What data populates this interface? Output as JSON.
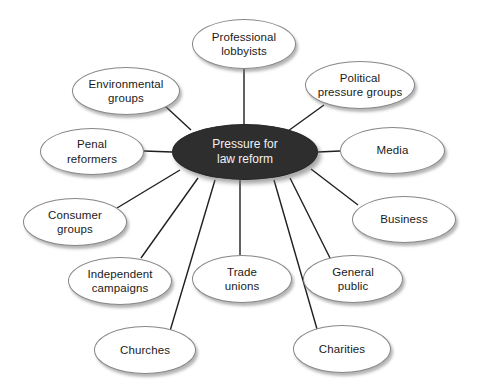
{
  "diagram": {
    "type": "hub-and-spoke",
    "background_color": "#ffffff",
    "center": {
      "label": "Pressure for law reform",
      "line1": "Pressure for",
      "line2": "law reform",
      "fill_color": "#2e2e2e",
      "text_color": "#f2f2f2",
      "x": 172,
      "y": 124,
      "width": 146,
      "height": 56
    },
    "node_style": {
      "fill_color": "#ffffff",
      "border_color": "#878787",
      "text_color": "#1a1a1a",
      "shadow_color": "#787878"
    },
    "nodes": [
      {
        "id": "professional-lobbyists",
        "label": "Professional lobbyists",
        "line1": "Professional",
        "line2": "lobbyists",
        "x": 192,
        "y": 19,
        "width": 104,
        "height": 50,
        "anchor_x": 244,
        "anchor_y": 69
      },
      {
        "id": "political-pressure-groups",
        "label": "Political pressure groups",
        "line1": "Political",
        "line2": "pressure groups",
        "x": 305,
        "y": 61,
        "width": 110,
        "height": 48,
        "anchor_x": 324,
        "anchor_y": 105
      },
      {
        "id": "media",
        "label": "Media",
        "line1": "Media",
        "line2": "",
        "x": 340,
        "y": 127,
        "width": 105,
        "height": 47,
        "anchor_x": 340,
        "anchor_y": 151
      },
      {
        "id": "business",
        "label": "Business",
        "line1": "Business",
        "line2": "",
        "x": 352,
        "y": 196,
        "width": 104,
        "height": 47,
        "anchor_x": 358,
        "anchor_y": 205
      },
      {
        "id": "general-public",
        "label": "General public",
        "line1": "General",
        "line2": "public",
        "x": 303,
        "y": 255,
        "width": 100,
        "height": 48,
        "anchor_x": 330,
        "anchor_y": 258
      },
      {
        "id": "charities",
        "label": "Charities",
        "line1": "Charities",
        "line2": "",
        "x": 293,
        "y": 325,
        "width": 98,
        "height": 48,
        "anchor_x": 317,
        "anchor_y": 329
      },
      {
        "id": "trade-unions",
        "label": "Trade unions",
        "line1": "Trade",
        "line2": "unions",
        "x": 192,
        "y": 255,
        "width": 100,
        "height": 48,
        "anchor_x": 240,
        "anchor_y": 255
      },
      {
        "id": "churches",
        "label": "Churches",
        "line1": "Churches",
        "line2": "",
        "x": 94,
        "y": 326,
        "width": 102,
        "height": 48,
        "anchor_x": 170,
        "anchor_y": 331
      },
      {
        "id": "independent-campaigns",
        "label": "Independent campaigns",
        "line1": "Independent",
        "line2": "campaigns",
        "x": 68,
        "y": 257,
        "width": 104,
        "height": 48,
        "anchor_x": 141,
        "anchor_y": 258
      },
      {
        "id": "consumer-groups",
        "label": "Consumer groups",
        "line1": "Consumer",
        "line2": "groups",
        "x": 23,
        "y": 198,
        "width": 104,
        "height": 48,
        "anchor_x": 117,
        "anchor_y": 208
      },
      {
        "id": "penal-reformers",
        "label": "Penal reformers",
        "line1": "Penal",
        "line2": "reformers",
        "x": 40,
        "y": 128,
        "width": 104,
        "height": 47,
        "anchor_x": 144,
        "anchor_y": 151
      },
      {
        "id": "environmental-groups",
        "label": "Environmental groups",
        "line1": "Environmental",
        "line2": "groups",
        "x": 72,
        "y": 67,
        "width": 108,
        "height": 48,
        "anchor_x": 165,
        "anchor_y": 106
      }
    ],
    "edges": [
      {
        "from": "center",
        "to": "professional-lobbyists",
        "x1": 244,
        "y1": 124,
        "x2": 244,
        "y2": 69
      },
      {
        "from": "center",
        "to": "political-pressure-groups",
        "x1": 288,
        "y1": 131,
        "x2": 324,
        "y2": 105
      },
      {
        "from": "center",
        "to": "media",
        "x1": 318,
        "y1": 152,
        "x2": 340,
        "y2": 151
      },
      {
        "from": "center",
        "to": "business",
        "x1": 311,
        "y1": 169,
        "x2": 358,
        "y2": 205
      },
      {
        "from": "center",
        "to": "general-public",
        "x1": 290,
        "y1": 178,
        "x2": 330,
        "y2": 258
      },
      {
        "from": "center",
        "to": "charities",
        "x1": 274,
        "y1": 180,
        "x2": 317,
        "y2": 329
      },
      {
        "from": "center",
        "to": "trade-unions",
        "x1": 240,
        "y1": 180,
        "x2": 240,
        "y2": 255
      },
      {
        "from": "center",
        "to": "churches",
        "x1": 215,
        "y1": 180,
        "x2": 170,
        "y2": 331
      },
      {
        "from": "center",
        "to": "independent-campaigns",
        "x1": 198,
        "y1": 178,
        "x2": 141,
        "y2": 258
      },
      {
        "from": "center",
        "to": "consumer-groups",
        "x1": 180,
        "y1": 170,
        "x2": 117,
        "y2": 208
      },
      {
        "from": "center",
        "to": "penal-reformers",
        "x1": 172,
        "y1": 152,
        "x2": 144,
        "y2": 151
      },
      {
        "from": "center",
        "to": "environmental-groups",
        "x1": 191,
        "y1": 130,
        "x2": 165,
        "y2": 106
      }
    ]
  }
}
